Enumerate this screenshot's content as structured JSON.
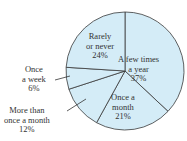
{
  "chart_data": {
    "type": "pie",
    "title": "",
    "categories": [
      "A few times a year",
      "Once a month",
      "More than once a month",
      "Once a week",
      "Rarely or never"
    ],
    "values": [
      37,
      21,
      12,
      6,
      24
    ],
    "unit": "%",
    "fill_color": "#d4ecf7",
    "stroke_color": "#3a3a3a",
    "labels": [
      {
        "line1": "A few times",
        "line2": "a year",
        "pct": "37%"
      },
      {
        "line1": "Once a",
        "line2": "month",
        "pct": "21%"
      },
      {
        "line1": "More than",
        "line2": "once a month",
        "pct": "12%"
      },
      {
        "line1": "Once",
        "line2": "a week",
        "pct": "6%"
      },
      {
        "line1": "Rarely",
        "line2": "or never",
        "pct": "24%"
      }
    ]
  }
}
